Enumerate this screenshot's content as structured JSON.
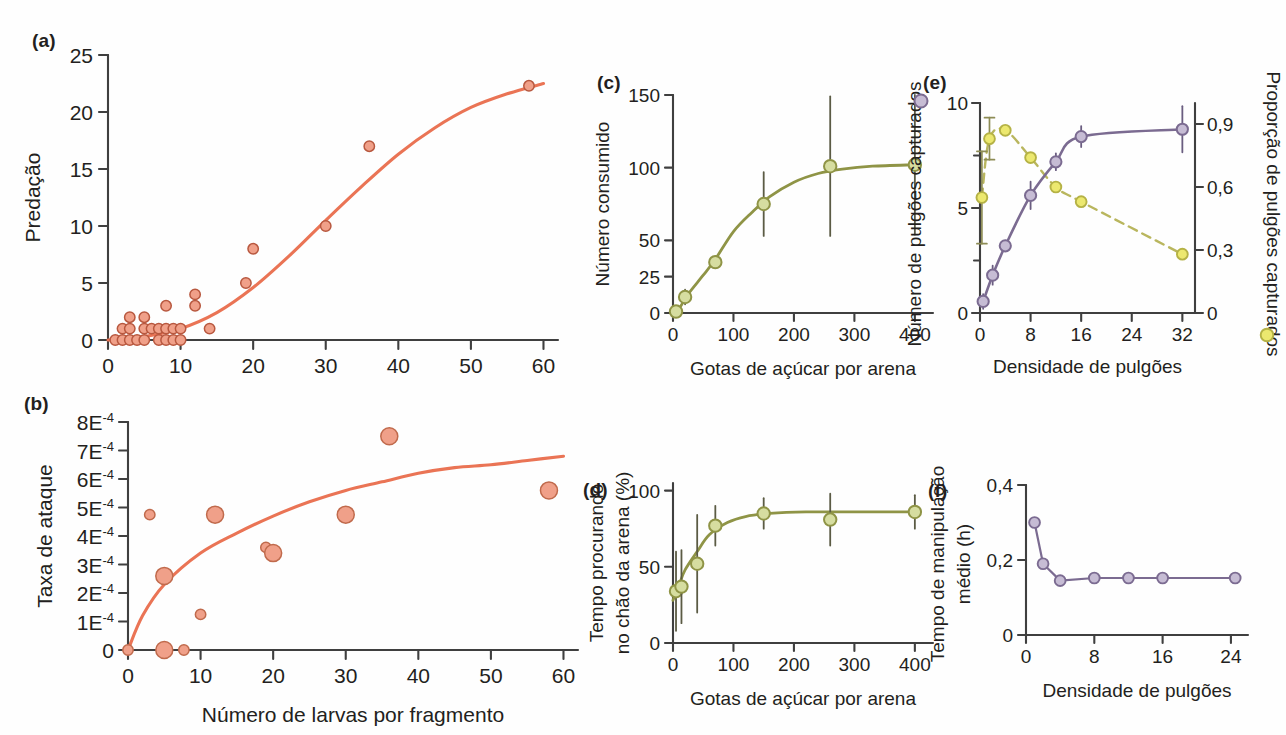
{
  "figure": {
    "panels": [
      "a",
      "b",
      "c",
      "d",
      "e",
      "f"
    ],
    "colors": {
      "coral": "#ea7455",
      "coral_fill": "#f0a089",
      "olive": "#8f9446",
      "olive_fill": "#d6dda0",
      "purple": "#7b6b91",
      "purple_fill": "#c6bcd4",
      "yellow": "#ded84a",
      "yellow_fill": "#ece86f",
      "axis": "#3f3f3f"
    }
  },
  "chart_data": [
    {
      "panel": "a",
      "type": "scatter",
      "title": "(a)",
      "xlabel": "Número de larvas por fragmento",
      "ylabel": "Predação",
      "xlim": [
        0,
        62
      ],
      "ylim": [
        0,
        25
      ],
      "xticks": [
        0,
        10,
        20,
        30,
        40,
        50,
        60
      ],
      "yticks": [
        0,
        5,
        10,
        15,
        20,
        25
      ],
      "grid": false,
      "legend": "none",
      "points": [
        [
          1,
          0
        ],
        [
          2,
          0
        ],
        [
          2,
          1
        ],
        [
          3,
          0
        ],
        [
          3,
          1
        ],
        [
          3,
          2
        ],
        [
          4,
          0
        ],
        [
          5,
          0
        ],
        [
          5,
          2
        ],
        [
          5,
          1
        ],
        [
          6,
          1
        ],
        [
          7,
          1
        ],
        [
          7,
          0
        ],
        [
          8,
          1
        ],
        [
          8,
          3
        ],
        [
          8,
          0
        ],
        [
          9,
          1
        ],
        [
          9,
          0
        ],
        [
          10,
          1
        ],
        [
          10,
          0
        ],
        [
          12,
          4
        ],
        [
          12,
          3
        ],
        [
          14,
          1
        ],
        [
          19,
          5
        ],
        [
          20,
          8
        ],
        [
          30,
          10
        ],
        [
          36,
          17
        ],
        [
          58,
          22.3
        ]
      ],
      "fit_curve": {
        "name": "sigmoid fit",
        "points": [
          [
            0,
            0
          ],
          [
            5,
            0.3
          ],
          [
            10,
            1.0
          ],
          [
            15,
            2.4
          ],
          [
            20,
            4.6
          ],
          [
            25,
            7.4
          ],
          [
            30,
            10.5
          ],
          [
            35,
            13.5
          ],
          [
            40,
            16.3
          ],
          [
            45,
            18.6
          ],
          [
            50,
            20.4
          ],
          [
            55,
            21.6
          ],
          [
            60,
            22.5
          ]
        ]
      }
    },
    {
      "panel": "b",
      "type": "scatter",
      "title": "(b)",
      "xlabel": "Número de larvas por fragmento",
      "ylabel": "Taxa de ataque",
      "xlim": [
        0,
        62
      ],
      "ylim": [
        0,
        8
      ],
      "xticks": [
        0,
        10,
        20,
        30,
        40,
        50,
        60
      ],
      "yticks": [
        0,
        1,
        2,
        3,
        4,
        5,
        6,
        7,
        8
      ],
      "ytick_labels": [
        "0",
        "1E-4",
        "2E-4",
        "3E-4",
        "4E-4",
        "5E-4",
        "6E-4",
        "7E-4",
        "8E-4"
      ],
      "ytick_exponent": "-4",
      "grid": false,
      "legend": "none",
      "points": [
        {
          "x": 0,
          "y": 0,
          "size": "s"
        },
        {
          "x": 3,
          "y": 4.75,
          "size": "s"
        },
        {
          "x": 5,
          "y": 2.6,
          "size": "l"
        },
        {
          "x": 5,
          "y": 0,
          "size": "l"
        },
        {
          "x": 7.7,
          "y": 0,
          "size": "s"
        },
        {
          "x": 10,
          "y": 1.25,
          "size": "s"
        },
        {
          "x": 12,
          "y": 4.75,
          "size": "l"
        },
        {
          "x": 19,
          "y": 3.6,
          "size": "s"
        },
        {
          "x": 20,
          "y": 3.4,
          "size": "l"
        },
        {
          "x": 30,
          "y": 4.75,
          "size": "l"
        },
        {
          "x": 36,
          "y": 7.5,
          "size": "l"
        },
        {
          "x": 58,
          "y": 5.6,
          "size": "l"
        }
      ],
      "fit_curve": {
        "name": "saturating fit",
        "points": [
          [
            0,
            0
          ],
          [
            2,
            1.2
          ],
          [
            5,
            2.3
          ],
          [
            10,
            3.4
          ],
          [
            15,
            4.1
          ],
          [
            20,
            4.7
          ],
          [
            25,
            5.2
          ],
          [
            30,
            5.6
          ],
          [
            35,
            5.9
          ],
          [
            40,
            6.2
          ],
          [
            45,
            6.4
          ],
          [
            50,
            6.5
          ],
          [
            55,
            6.65
          ],
          [
            60,
            6.8
          ]
        ]
      }
    },
    {
      "panel": "c",
      "type": "line",
      "title": "(c)",
      "xlabel": "Gotas de açúcar por arena",
      "ylabel": "Número consumido",
      "xlim": [
        0,
        430
      ],
      "ylim": [
        0,
        150
      ],
      "xticks": [
        0,
        100,
        200,
        300,
        400
      ],
      "yticks": [
        0,
        25,
        50,
        100,
        150
      ],
      "grid": false,
      "legend": "none",
      "points": [
        {
          "x": 5,
          "y": 1,
          "err": 1
        },
        {
          "x": 20,
          "y": 11,
          "err": 5
        },
        {
          "x": 70,
          "y": 35,
          "err": 4
        },
        {
          "x": 150,
          "y": 75,
          "err": 22
        },
        {
          "x": 260,
          "y": 101,
          "err": 48
        },
        {
          "x": 400,
          "y": 102,
          "err": 48
        }
      ],
      "fit_curve": {
        "name": "sigmoid fit",
        "points": [
          [
            0,
            0
          ],
          [
            10,
            3
          ],
          [
            25,
            13
          ],
          [
            50,
            26
          ],
          [
            70,
            37
          ],
          [
            100,
            56
          ],
          [
            130,
            69
          ],
          [
            160,
            80
          ],
          [
            200,
            90
          ],
          [
            240,
            96
          ],
          [
            280,
            99
          ],
          [
            330,
            101
          ],
          [
            400,
            102
          ]
        ]
      }
    },
    {
      "panel": "d",
      "type": "line",
      "title": "(d)",
      "xlabel": "Gotas de açúcar por arena",
      "ylabel": "Tempo procurando no chão da arena (%)",
      "xlim": [
        0,
        430
      ],
      "ylim": [
        0,
        105
      ],
      "xticks": [
        0,
        100,
        200,
        300,
        400
      ],
      "yticks": [
        0,
        50,
        100
      ],
      "grid": false,
      "legend": "none",
      "points": [
        {
          "x": 5,
          "y": 34,
          "err": 26
        },
        {
          "x": 14,
          "y": 37,
          "err": 24
        },
        {
          "x": 40,
          "y": 52,
          "err": 32
        },
        {
          "x": 70,
          "y": 77,
          "err": 13
        },
        {
          "x": 150,
          "y": 85,
          "err": 10
        },
        {
          "x": 260,
          "y": 81,
          "err": 17
        },
        {
          "x": 400,
          "y": 86,
          "err": 11
        }
      ],
      "fit_curve": {
        "name": "saturating fit",
        "points": [
          [
            0,
            28
          ],
          [
            10,
            38
          ],
          [
            20,
            48
          ],
          [
            40,
            60
          ],
          [
            60,
            71
          ],
          [
            90,
            79
          ],
          [
            120,
            83
          ],
          [
            160,
            85
          ],
          [
            220,
            86
          ],
          [
            300,
            86
          ],
          [
            400,
            86
          ]
        ]
      }
    },
    {
      "panel": "e",
      "type": "line",
      "title": "(e)",
      "xlabel": "Densidade de pulgões",
      "ylabel_left": "Número de pulgões capturados (○)",
      "ylabel_left_text": "Número de pulgões capturados",
      "ylabel_right_text": "Proporção de pulgões capturados",
      "xlim": [
        0,
        34
      ],
      "ylim_left": [
        0,
        10
      ],
      "ylim_right": [
        0,
        1.0
      ],
      "xticks": [
        0,
        8,
        16,
        24,
        32
      ],
      "yticks_left": [
        0,
        5,
        10
      ],
      "yticks_right_values": [
        0,
        0.3,
        0.6,
        0.9
      ],
      "yticks_right_labels": [
        "0",
        "0,3",
        "0,6",
        "0,9"
      ],
      "grid": false,
      "legend": "inline-axis-symbols",
      "series": [
        {
          "name": "Número de pulgões capturados",
          "axis": "left",
          "marker": "circle-purple",
          "linestyle": "solid",
          "points": [
            {
              "x": 0.5,
              "y": 0.55,
              "err": 0.35
            },
            {
              "x": 2,
              "y": 1.8,
              "err": 0.45
            },
            {
              "x": 4,
              "y": 3.2,
              "err": 0.25
            },
            {
              "x": 8,
              "y": 5.6,
              "err": 0.65
            },
            {
              "x": 12,
              "y": 7.2,
              "err": 0.4
            },
            {
              "x": 16,
              "y": 8.4,
              "err": 0.5
            },
            {
              "x": 32,
              "y": 8.75,
              "err": 1.1
            }
          ]
        },
        {
          "name": "Proporção de pulgões capturados",
          "axis": "right",
          "marker": "circle-yellow",
          "linestyle": "dashed",
          "points": [
            {
              "x": 0.3,
              "y": 0.55,
              "err": 0.22
            },
            {
              "x": 1.5,
              "y": 0.83,
              "err": 0.1
            },
            {
              "x": 4,
              "y": 0.87,
              "err": 0.0
            },
            {
              "x": 8,
              "y": 0.74,
              "err": 0.0
            },
            {
              "x": 12,
              "y": 0.6,
              "err": 0.0
            },
            {
              "x": 16,
              "y": 0.53,
              "err": 0.0
            },
            {
              "x": 32,
              "y": 0.28,
              "err": 0.0
            }
          ]
        }
      ]
    },
    {
      "panel": "f",
      "type": "line",
      "title": "(f)",
      "xlabel": "Densidade de pulgões",
      "ylabel": "Tempo de manipulação médio (h)",
      "xlim": [
        0,
        26
      ],
      "ylim": [
        0,
        0.4
      ],
      "xticks": [
        0,
        8,
        16,
        24
      ],
      "yticks": [
        0,
        0.2,
        0.4
      ],
      "ytick_labels": [
        "0",
        "0,2",
        "0,4"
      ],
      "grid": false,
      "legend": "none",
      "points": [
        {
          "x": 1,
          "y": 0.3
        },
        {
          "x": 2,
          "y": 0.19
        },
        {
          "x": 4,
          "y": 0.145
        },
        {
          "x": 8,
          "y": 0.152
        },
        {
          "x": 12,
          "y": 0.152
        },
        {
          "x": 16,
          "y": 0.152
        },
        {
          "x": 24.5,
          "y": 0.152
        }
      ]
    }
  ]
}
